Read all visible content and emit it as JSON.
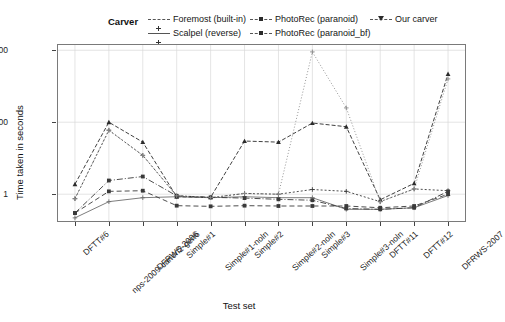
{
  "legend": {
    "title": "Carver",
    "columns": [
      [
        {
          "label": "Foremost (built-in)",
          "style": "dotted",
          "marker": "plus"
        },
        {
          "label": "Scalpel (reverse)",
          "style": "solid",
          "marker": "plus"
        }
      ],
      [
        {
          "label": "PhotoRec (paranoid)",
          "style": "dashed",
          "marker": "square"
        },
        {
          "label": "PhotoRec (paranoid_bf)",
          "style": "dashdot",
          "marker": "square"
        }
      ],
      [
        {
          "label": "Our carver",
          "style": "dashed",
          "marker": "triangle"
        }
      ]
    ]
  },
  "chart_data": {
    "type": "line",
    "title": "",
    "xlabel": "Test set",
    "ylabel": "Time taken in seconds",
    "yscale": "log10",
    "ylim": [
      0.18,
      14000
    ],
    "yticks": [
      1,
      100,
      10000
    ],
    "ytick_labels": [
      "1",
      "100",
      "10000"
    ],
    "grid": true,
    "legend_position": "top",
    "categories": [
      "DFTT#6",
      "nps-2009-canon2-gen6",
      "DFRWS-2006",
      "Simple#1",
      "Simple#1-noln",
      "Simple#2",
      "Simple#2-noln",
      "Simple#3",
      "Simple#3-noln",
      "DFTT#11",
      "DFTT#12",
      "DFRWS-2007"
    ],
    "series": [
      {
        "name": "Foremost (built-in)",
        "color": "#3a3a3a",
        "dash": "2 2",
        "marker": "plus",
        "values": [
          0.75,
          60,
          12,
          0.9,
          0.8,
          1.05,
          1.0,
          1.35,
          1.2,
          0.62,
          1.4,
          1.25
        ]
      },
      {
        "name": "Scalpel (reverse)",
        "color": "#6e6e6e",
        "dash": "none",
        "marker": "plus",
        "values": [
          0.22,
          0.62,
          0.8,
          0.85,
          0.8,
          0.85,
          0.8,
          0.8,
          0.38,
          0.38,
          0.42,
          0.92
        ]
      },
      {
        "name": "PhotoRec (paranoid)",
        "color": "#3a3a3a",
        "dash": "5 3",
        "marker": "square",
        "values": [
          0.3,
          1.2,
          1.25,
          0.48,
          0.46,
          0.48,
          0.47,
          0.47,
          0.47,
          0.42,
          0.47,
          1.0
        ]
      },
      {
        "name": "PhotoRec (paranoid_bf)",
        "color": "#3a3a3a",
        "dash": "6 2 1 2",
        "marker": "square",
        "values": [
          0.3,
          2.4,
          3.1,
          0.9,
          0.82,
          0.78,
          0.72,
          0.68,
          0.4,
          0.38,
          0.42,
          1.2
        ]
      },
      {
        "name": "Our carver",
        "color": "#2b2b2b",
        "dash": "4 2",
        "marker": "triangle",
        "values": [
          1.9,
          100,
          28,
          0.85,
          0.82,
          30,
          28,
          95,
          75,
          0.7,
          2.0,
          2200
        ]
      },
      {
        "name": "Foremost-high",
        "color": "#8a8a8a",
        "dash": "1 2",
        "marker": "plus",
        "hidden_in_legend": true,
        "values": [
          0.75,
          60,
          12,
          0.9,
          0.8,
          1.05,
          1.0,
          9000,
          250,
          0.62,
          1.4,
          1600
        ]
      }
    ]
  }
}
